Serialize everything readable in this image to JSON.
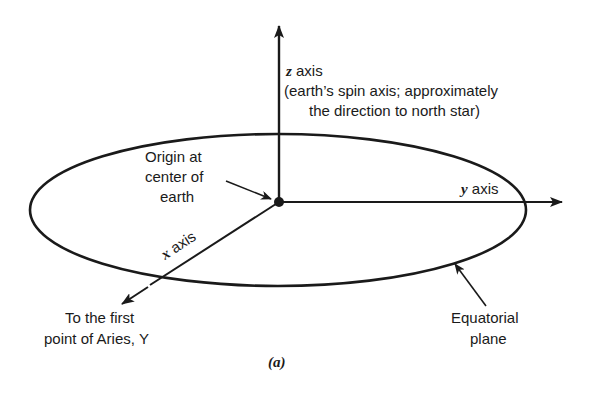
{
  "figure": {
    "caption": "(a)",
    "z_axis": {
      "symbol": "z",
      "label": " axis",
      "note_line1": "(earth’s spin axis; approximately",
      "note_line2": "the direction to north star)"
    },
    "y_axis": {
      "symbol": "y",
      "label": " axis"
    },
    "x_axis": {
      "symbol": "x",
      "label": " axis"
    },
    "origin": {
      "line1": "Origin at",
      "line2": "center of",
      "line3": "earth"
    },
    "aries": {
      "line1": "To the first",
      "line2": "point of Aries, Υ"
    },
    "plane": {
      "line1": "Equatorial",
      "line2": "plane"
    },
    "colors": {
      "ink": "#1a1a1a",
      "background": "#ffffff"
    }
  }
}
